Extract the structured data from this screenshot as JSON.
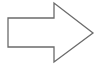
{
  "diagram": {
    "shape": "right-arrow",
    "stroke_color": "#6b6b6b",
    "fill_color": "#ffffff",
    "background": "#ffffff",
    "points": "8,18 54,18 54,3 93,33 54,62 54,47 8,47"
  }
}
